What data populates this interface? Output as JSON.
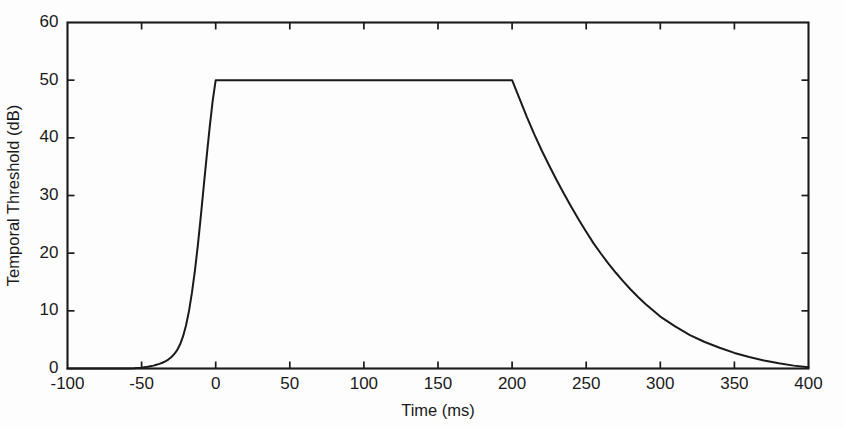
{
  "figure": {
    "background_color": "#fdfdfd",
    "line_color": "#1a1a1a"
  },
  "chart_data": {
    "type": "line",
    "title": "",
    "xlabel": "Time (ms)",
    "ylabel": "Temporal Threshold (dB)",
    "xlim": [
      -100,
      400
    ],
    "ylim": [
      0,
      60
    ],
    "xticks": [
      -100,
      -50,
      0,
      50,
      100,
      150,
      200,
      250,
      300,
      350,
      400
    ],
    "xtick_labels": [
      "-100",
      "-50",
      "0",
      "50",
      "100",
      "150",
      "200",
      "250",
      "300",
      "350",
      "400"
    ],
    "yticks": [
      0,
      10,
      20,
      30,
      40,
      50,
      60
    ],
    "ytick_labels": [
      "0",
      "10",
      "20",
      "30",
      "40",
      "50",
      "60"
    ],
    "grid": false,
    "legend": null,
    "series": [
      {
        "name": "Temporal masking threshold",
        "color": "#1a1a1a",
        "x": [
          -100,
          -90,
          -80,
          -70,
          -60,
          -55,
          -50,
          -46,
          -44,
          -42,
          -40,
          -38,
          -36,
          -34,
          -32,
          -30,
          -28,
          -26,
          -24,
          -22,
          -20,
          -18,
          -16,
          -14,
          -12,
          -10,
          -8,
          -6,
          -4,
          -2,
          0,
          20,
          40,
          60,
          80,
          100,
          120,
          140,
          160,
          180,
          195,
          200,
          205,
          210,
          215,
          220,
          225,
          230,
          235,
          240,
          245,
          250,
          255,
          260,
          265,
          270,
          275,
          280,
          285,
          290,
          295,
          300,
          310,
          320,
          330,
          340,
          350,
          360,
          370,
          380,
          390,
          400
        ],
        "y": [
          0,
          0,
          0,
          0,
          0,
          0.05,
          0.15,
          0.3,
          0.4,
          0.5,
          0.65,
          0.8,
          1.0,
          1.25,
          1.55,
          1.95,
          2.5,
          3.2,
          4.2,
          5.6,
          7.5,
          10.0,
          13.2,
          17.0,
          21.5,
          26.5,
          31.8,
          37.0,
          42.0,
          46.5,
          50.0,
          50.0,
          50.0,
          50.0,
          50.0,
          50.0,
          50.0,
          50.0,
          50.0,
          50.0,
          50.0,
          50.0,
          46.8,
          43.6,
          40.6,
          37.8,
          35.2,
          32.7,
          30.3,
          28.0,
          25.8,
          23.7,
          21.7,
          19.9,
          18.2,
          16.6,
          15.1,
          13.7,
          12.4,
          11.2,
          10.1,
          9.0,
          7.3,
          5.8,
          4.6,
          3.6,
          2.7,
          2.0,
          1.4,
          0.9,
          0.5,
          0.2
        ]
      }
    ],
    "annotations": {
      "plateau_level_db": 50,
      "plateau_start_ms": 0,
      "plateau_end_ms": 200,
      "onset_start_ms": -55,
      "decay_end_ms": 400
    }
  }
}
